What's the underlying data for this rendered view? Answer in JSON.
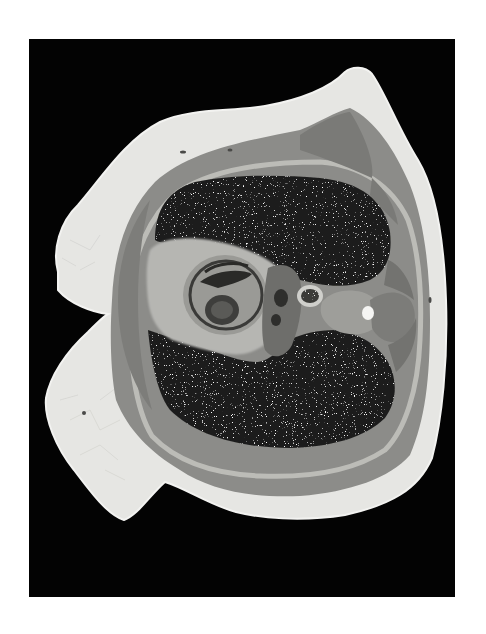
{
  "image": {
    "description": "Photograph of a transverse anatomical cross-section of a torso (thorax level) on a black background, showing lungs, heart, vertebra, muscle and subcutaneous fat layers",
    "background_color": "#030303",
    "page_color": "#ffffff",
    "colors": {
      "fat": "#e8e8e6",
      "muscle": "#8a8a88",
      "lung": "#1e1e1e",
      "mediastinum": "#b4b4b0",
      "heart_chamber": "#4a4a48",
      "bone": "#f4f4f2"
    },
    "regions": [
      {
        "name": "subcutaneous-fat-layer"
      },
      {
        "name": "muscle-layer"
      },
      {
        "name": "upper-lung"
      },
      {
        "name": "lower-lung"
      },
      {
        "name": "heart"
      },
      {
        "name": "vertebra"
      },
      {
        "name": "spinal-canal"
      }
    ]
  }
}
